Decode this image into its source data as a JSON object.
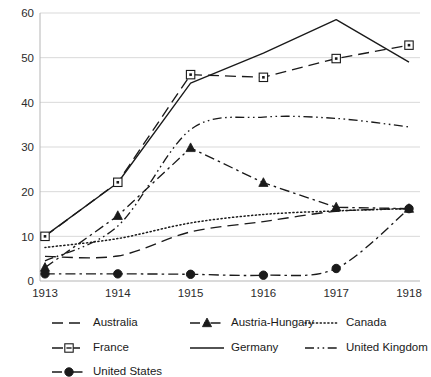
{
  "chart_data": {
    "type": "line",
    "title": "",
    "xlabel": "",
    "ylabel": "",
    "x": [
      1913,
      1914,
      1915,
      1916,
      1917,
      1918
    ],
    "xtick_labels": [
      "1913",
      "1914",
      "1915",
      "1916",
      "1917",
      "1918"
    ],
    "ytick_labels": [
      "0",
      "10",
      "20",
      "30",
      "40",
      "50",
      "60"
    ],
    "yticks": [
      0,
      10,
      20,
      30,
      40,
      50,
      60
    ],
    "ylim": [
      0,
      62
    ],
    "xlim": [
      1912.6,
      1918.4
    ],
    "grid": true,
    "legend_position": "bottom",
    "series": [
      {
        "name": "Australia",
        "style": "dashed",
        "marker": "none",
        "values": [
          5.5,
          5.6,
          11.0,
          13.3,
          15.6,
          16.2
        ]
      },
      {
        "name": "Austria-Hungary",
        "style": "dash-dot",
        "marker": "triangle",
        "values": [
          3.0,
          14.6,
          29.8,
          22.0,
          16.5,
          16.2
        ]
      },
      {
        "name": "Canada",
        "style": "dotted",
        "marker": "none",
        "values": [
          7.5,
          9.5,
          13.0,
          14.9,
          15.7,
          16.2
        ]
      },
      {
        "name": "France",
        "style": "dashed",
        "marker": "square",
        "values": [
          10.0,
          22.1,
          46.2,
          45.6,
          49.8,
          52.8
        ]
      },
      {
        "name": "Germany",
        "style": "solid",
        "marker": "none",
        "values": [
          10.1,
          22.0,
          44.3,
          51.0,
          58.5,
          49.0
        ]
      },
      {
        "name": "United Kingdom",
        "style": "dash-dot-dot",
        "marker": "none",
        "values": [
          4.5,
          12.3,
          33.9,
          36.7,
          36.4,
          34.5
        ]
      },
      {
        "name": "United States",
        "style": "dash-dot",
        "marker": "circle",
        "values": [
          1.6,
          1.6,
          1.5,
          1.3,
          2.8,
          16.2
        ]
      }
    ]
  },
  "legend": {
    "entries": [
      {
        "label": "Australia"
      },
      {
        "label": "Austria-Hungary"
      },
      {
        "label": "Canada"
      },
      {
        "label": "France"
      },
      {
        "label": "Germany"
      },
      {
        "label": "United Kingdom"
      },
      {
        "label": "United States"
      }
    ]
  },
  "colors": {
    "ink": "#1a1a1a",
    "grid": "#d9d9d9",
    "axis": "#b5b5b5",
    "background": "#ffffff"
  }
}
